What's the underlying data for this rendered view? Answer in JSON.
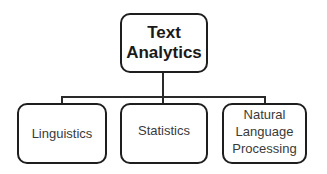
{
  "diagram": {
    "type": "hierarchy",
    "root": {
      "label": "Text\nAnalytics"
    },
    "children": [
      {
        "label": "Linguistics"
      },
      {
        "label": "Statistics"
      },
      {
        "label": "Natural\nLanguage\nProcessing"
      }
    ],
    "colors": {
      "border": "#1e1e1e",
      "background": "#ffffff",
      "text": "#2a2a2a"
    }
  }
}
